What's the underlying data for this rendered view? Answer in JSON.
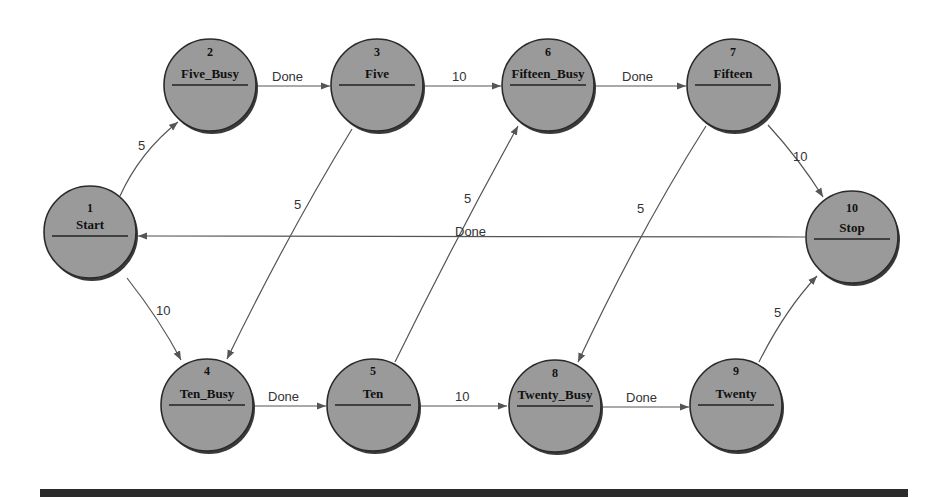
{
  "diagram": {
    "type": "state-transition-diagram",
    "colors": {
      "node_fill": "#9a9a9a",
      "node_stroke": "#2a2a2a",
      "edge": "#555555",
      "bottom_bar": "#2b2b2b"
    },
    "nodes": [
      {
        "id": "1",
        "name": "Start"
      },
      {
        "id": "2",
        "name": "Five_Busy"
      },
      {
        "id": "3",
        "name": "Five"
      },
      {
        "id": "4",
        "name": "Ten_Busy"
      },
      {
        "id": "5",
        "name": "Ten"
      },
      {
        "id": "6",
        "name": "Fifteen_Busy"
      },
      {
        "id": "7",
        "name": "Fifteen"
      },
      {
        "id": "8",
        "name": "Twenty_Busy"
      },
      {
        "id": "9",
        "name": "Twenty"
      },
      {
        "id": "10",
        "name": "Stop"
      }
    ],
    "edges": [
      {
        "from": "1",
        "to": "2",
        "label": "5"
      },
      {
        "from": "1",
        "to": "4",
        "label": "10"
      },
      {
        "from": "2",
        "to": "3",
        "label": "Done"
      },
      {
        "from": "3",
        "to": "6",
        "label": "10"
      },
      {
        "from": "3",
        "to": "4",
        "label": "5"
      },
      {
        "from": "4",
        "to": "5",
        "label": "Done"
      },
      {
        "from": "5",
        "to": "8",
        "label": "10"
      },
      {
        "from": "5",
        "to": "6",
        "label": "5"
      },
      {
        "from": "6",
        "to": "7",
        "label": "Done"
      },
      {
        "from": "7",
        "to": "10",
        "label": "10"
      },
      {
        "from": "7",
        "to": "8",
        "label": "5"
      },
      {
        "from": "8",
        "to": "9",
        "label": "Done"
      },
      {
        "from": "9",
        "to": "10",
        "label": "5"
      },
      {
        "from": "10",
        "to": "1",
        "label": "Done"
      }
    ]
  }
}
